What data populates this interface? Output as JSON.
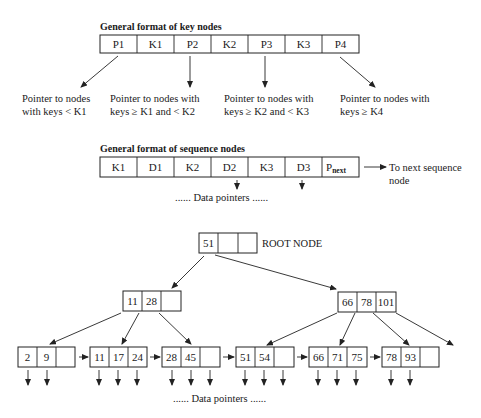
{
  "key_node_format": {
    "heading": "General format of key nodes",
    "cells": [
      "P1",
      "K1",
      "P2",
      "K2",
      "P3",
      "K3",
      "P4"
    ],
    "pointer_labels": [
      {
        "line1": "Pointer to nodes",
        "line2": "with keys < K1"
      },
      {
        "line1": "Pointer to nodes with",
        "line2": "keys ≥ K1 and < K2"
      },
      {
        "line1": "Pointer to nodes with",
        "line2": "keys ≥ K2 and < K3"
      },
      {
        "line1": "Pointer to nodes with",
        "line2": "keys ≥ K4"
      }
    ]
  },
  "sequence_node_format": {
    "heading": "General format of sequence nodes",
    "cells": [
      "K1",
      "D1",
      "K2",
      "D2",
      "K3",
      "D3"
    ],
    "pnext_main": "P",
    "pnext_sub": "next",
    "next_label_line1": "To next sequence",
    "next_label_line2": "node",
    "data_pointers_label": "...... Data pointers ......"
  },
  "tree": {
    "root": {
      "cells": [
        "51",
        "",
        ""
      ],
      "label": "ROOT NODE"
    },
    "internal_left": {
      "cells": [
        "11",
        "28",
        ""
      ]
    },
    "internal_right": {
      "cells": [
        "66",
        "78",
        "101"
      ]
    },
    "leaves": [
      {
        "cells": [
          "2",
          "9",
          ""
        ]
      },
      {
        "cells": [
          "11",
          "17",
          "24"
        ]
      },
      {
        "cells": [
          "28",
          "45",
          ""
        ]
      },
      {
        "cells": [
          "51",
          "54",
          ""
        ]
      },
      {
        "cells": [
          "66",
          "71",
          "75"
        ]
      },
      {
        "cells": [
          "78",
          "93",
          ""
        ]
      }
    ],
    "data_pointers_label": "...... Data pointers ......"
  }
}
